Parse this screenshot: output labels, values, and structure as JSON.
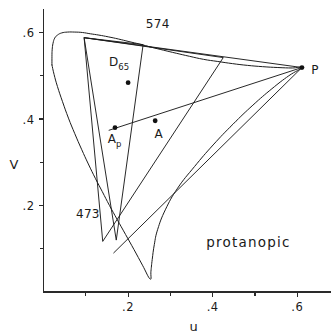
{
  "figure": {
    "caption": "protanopic",
    "background_color": "#ffffff",
    "ink_color": "#1a1a1a"
  },
  "axes": {
    "x": {
      "title": "u",
      "range": [
        0.0,
        0.68
      ],
      "labeled_ticks": [
        {
          "value": 0.2,
          "label": ".2"
        },
        {
          "value": 0.4,
          "label": ".4"
        },
        {
          "value": 0.6,
          "label": ".6"
        }
      ],
      "minor_ticks": [
        0.1,
        0.3,
        0.5
      ]
    },
    "y": {
      "title": "V",
      "range": [
        0.0,
        0.655
      ],
      "labeled_ticks": [
        {
          "value": 0.2,
          "label": ".2"
        },
        {
          "value": 0.4,
          "label": ".4"
        },
        {
          "value": 0.6,
          "label": ".6"
        }
      ],
      "minor_ticks": [
        0.1,
        0.3,
        0.5
      ]
    }
  },
  "annotations": {
    "wavelength_574": "574",
    "wavelength_473": "473",
    "point_P": "P",
    "point_A": "A",
    "point_Ap_base": "A",
    "point_Ap_sub": "p",
    "point_D65_base": "D",
    "point_D65_sub": "65"
  },
  "chart_data": {
    "type": "scatter",
    "title": "",
    "subtitle": "protanopic",
    "xlabel": "u",
    "ylabel": "V",
    "xlim": [
      0.0,
      0.68
    ],
    "ylim": [
      0.0,
      0.655
    ],
    "grid": false,
    "legend": "none",
    "named_points": [
      {
        "name": "D65",
        "u": 0.2,
        "v": 0.484,
        "label": "D65"
      },
      {
        "name": "Ap",
        "u": 0.169,
        "v": 0.38,
        "label": "Ap"
      },
      {
        "name": "A",
        "u": 0.264,
        "v": 0.396,
        "label": "A"
      },
      {
        "name": "P",
        "u": 0.611,
        "v": 0.519,
        "label": "P"
      }
    ],
    "spectral_locus": {
      "name": "CIE 1960 UCS spectral locus",
      "closed": true,
      "points": [
        [
          0.02,
          0.525
        ],
        [
          0.02,
          0.545
        ],
        [
          0.0205,
          0.56
        ],
        [
          0.0225,
          0.575
        ],
        [
          0.0265,
          0.587
        ],
        [
          0.033,
          0.594
        ],
        [
          0.043,
          0.599
        ],
        [
          0.057,
          0.601
        ],
        [
          0.074,
          0.601
        ],
        [
          0.092,
          0.6
        ],
        [
          0.111,
          0.597
        ],
        [
          0.131,
          0.594
        ],
        [
          0.153,
          0.59
        ],
        [
          0.177,
          0.585
        ],
        [
          0.202,
          0.579
        ],
        [
          0.228,
          0.573
        ],
        [
          0.255,
          0.566
        ],
        [
          0.284,
          0.559
        ],
        [
          0.314,
          0.552
        ],
        [
          0.345,
          0.545
        ],
        [
          0.378,
          0.538
        ],
        [
          0.412,
          0.533
        ],
        [
          0.447,
          0.528
        ],
        [
          0.482,
          0.524
        ],
        [
          0.518,
          0.521
        ],
        [
          0.554,
          0.519
        ],
        [
          0.588,
          0.518
        ],
        [
          0.611,
          0.519
        ],
        [
          0.58,
          0.5
        ],
        [
          0.54,
          0.47
        ],
        [
          0.495,
          0.432
        ],
        [
          0.448,
          0.388
        ],
        [
          0.401,
          0.34
        ],
        [
          0.357,
          0.29
        ],
        [
          0.317,
          0.24
        ],
        [
          0.288,
          0.19
        ],
        [
          0.27,
          0.145
        ],
        [
          0.262,
          0.11
        ],
        [
          0.257,
          0.075
        ],
        [
          0.254,
          0.048
        ],
        [
          0.252,
          0.03
        ],
        [
          0.234,
          0.062
        ],
        [
          0.214,
          0.098
        ],
        [
          0.194,
          0.133
        ],
        [
          0.174,
          0.168
        ],
        [
          0.156,
          0.2
        ],
        [
          0.139,
          0.232
        ],
        [
          0.123,
          0.262
        ],
        [
          0.106,
          0.296
        ],
        [
          0.09,
          0.33
        ],
        [
          0.074,
          0.366
        ],
        [
          0.059,
          0.402
        ],
        [
          0.045,
          0.44
        ],
        [
          0.033,
          0.475
        ],
        [
          0.025,
          0.503
        ],
        [
          0.02,
          0.525
        ]
      ]
    },
    "small_triangle": {
      "name": "narrow triangle",
      "vertices": [
        [
          0.096,
          0.588
        ],
        [
          0.2355,
          0.572
        ],
        [
          0.172,
          0.12
        ]
      ]
    },
    "large_triangle": {
      "name": "protanopic confusion triangle",
      "vertices": [
        [
          0.096,
          0.588
        ],
        [
          0.425,
          0.542
        ],
        [
          0.14,
          0.117
        ]
      ]
    },
    "confusion_lines": [
      {
        "name": "P to Ap",
        "from": [
          0.611,
          0.519
        ],
        "to": [
          0.155,
          0.374
        ]
      },
      {
        "name": "P to 574 locus point",
        "from": [
          0.611,
          0.519
        ],
        "to": [
          0.096,
          0.588
        ]
      },
      {
        "name": "P to 473 locus point",
        "from": [
          0.611,
          0.519
        ],
        "to": [
          0.166,
          0.0905
        ]
      }
    ]
  }
}
